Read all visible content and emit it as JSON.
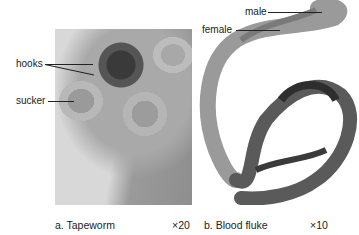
{
  "figure": {
    "panel_a": {
      "caption": "a. Tapeworm",
      "magnification": "×20",
      "labels": {
        "hooks": "hooks",
        "sucker": "sucker"
      }
    },
    "panel_b": {
      "caption": "b. Blood fluke",
      "magnification": "×10",
      "labels": {
        "male": "male",
        "female": "female"
      }
    }
  }
}
